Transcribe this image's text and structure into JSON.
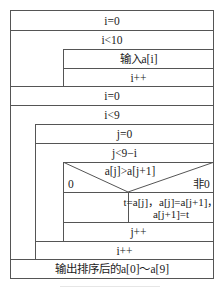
{
  "diagram": {
    "type": "nassi-shneiderman",
    "steps": {
      "init_i_1": "i=0",
      "loop1_cond": "i<10",
      "loop1_body_input": "输入a[i]",
      "loop1_body_inc": "i++",
      "init_i_2": "i=0",
      "loop2_cond": "i<9",
      "init_j": "j=0",
      "loop3_cond": "j<9−i",
      "if_cond": "a[j]>a[j+1]",
      "if_false_label": "0",
      "if_true_label": "非0",
      "swap_line1": "t=a[j]，a[j]=a[j+1]，",
      "swap_line2": "a[j+1]=t",
      "loop3_inc": "j++",
      "loop2_inc": "i++",
      "output": "输出排序后的a[0]～a[9]"
    },
    "line_color": "#555555"
  }
}
